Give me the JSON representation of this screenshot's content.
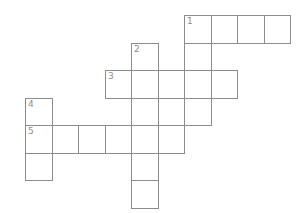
{
  "puzzle": {
    "type": "crossword",
    "origin_x": 25,
    "origin_y": 15,
    "cell_w": 26.5,
    "cell_h": 27.5,
    "line_color": "#8c8c8c",
    "cells": [
      {
        "r": 0,
        "c": 6,
        "num": "1"
      },
      {
        "r": 0,
        "c": 7
      },
      {
        "r": 0,
        "c": 8
      },
      {
        "r": 0,
        "c": 9
      },
      {
        "r": 1,
        "c": 4,
        "num": "2"
      },
      {
        "r": 1,
        "c": 6
      },
      {
        "r": 2,
        "c": 3,
        "num": "3"
      },
      {
        "r": 2,
        "c": 4
      },
      {
        "r": 2,
        "c": 5
      },
      {
        "r": 2,
        "c": 6
      },
      {
        "r": 2,
        "c": 7
      },
      {
        "r": 3,
        "c": 0,
        "num": "4"
      },
      {
        "r": 3,
        "c": 4
      },
      {
        "r": 3,
        "c": 5
      },
      {
        "r": 3,
        "c": 6
      },
      {
        "r": 4,
        "c": 0,
        "num": "5"
      },
      {
        "r": 4,
        "c": 1
      },
      {
        "r": 4,
        "c": 2
      },
      {
        "r": 4,
        "c": 3
      },
      {
        "r": 4,
        "c": 4
      },
      {
        "r": 4,
        "c": 5
      },
      {
        "r": 5,
        "c": 0
      },
      {
        "r": 5,
        "c": 4
      },
      {
        "r": 6,
        "c": 4
      }
    ],
    "entries": [
      {
        "number": "1",
        "direction": "across",
        "length": 4
      },
      {
        "number": "1",
        "direction": "down",
        "length": 5
      },
      {
        "number": "2",
        "direction": "down",
        "length": 6
      },
      {
        "number": "3",
        "direction": "across",
        "length": 5
      },
      {
        "number": "4",
        "direction": "down",
        "length": 3
      },
      {
        "number": "5",
        "direction": "across",
        "length": 6
      }
    ]
  }
}
